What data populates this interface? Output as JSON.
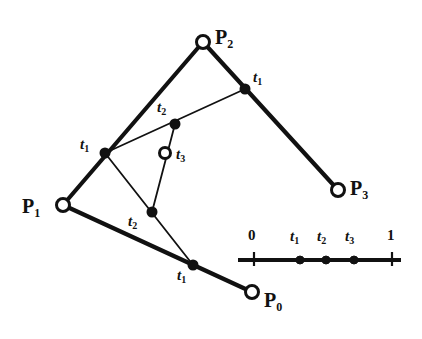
{
  "figure": {
    "kind": "de-casteljau-construction",
    "background_color": "#ffffff",
    "ink_color": "#111111",
    "width": 422,
    "height": 339,
    "thick_stroke": 4.2,
    "thin_stroke": 1.8
  },
  "control_points": [
    {
      "id": "p0",
      "label": "P",
      "sub": "0",
      "x": 252,
      "y": 292,
      "marker": "open-circle",
      "radius": 6.5,
      "label_x": 264,
      "label_y": 290
    },
    {
      "id": "p1",
      "label": "P",
      "sub": "1",
      "x": 63,
      "y": 205,
      "marker": "open-circle",
      "radius": 6.5,
      "label_x": 22,
      "label_y": 196
    },
    {
      "id": "p2",
      "label": "P",
      "sub": "2",
      "x": 203,
      "y": 42,
      "marker": "open-circle",
      "radius": 6.5,
      "label_x": 215,
      "label_y": 27
    },
    {
      "id": "p3",
      "label": "P",
      "sub": "3",
      "x": 338,
      "y": 190,
      "marker": "open-circle",
      "radius": 6.5,
      "label_x": 350,
      "label_y": 178
    }
  ],
  "level1_points": [
    {
      "id": "t1-lower",
      "label": "t",
      "sub": "1",
      "x": 193,
      "y": 265,
      "marker": "filled-dot",
      "radius": 4.5,
      "label_x": 177,
      "label_y": 268
    },
    {
      "id": "t1-left",
      "label": "t",
      "sub": "1",
      "x": 105,
      "y": 153,
      "marker": "filled-dot",
      "radius": 4.5,
      "label_x": 80,
      "label_y": 137
    },
    {
      "id": "t1-upper",
      "label": "t",
      "sub": "1",
      "x": 245,
      "y": 89,
      "marker": "filled-dot",
      "radius": 4.5,
      "label_x": 253,
      "label_y": 70
    }
  ],
  "level2_points": [
    {
      "id": "t2-lower",
      "label": "t",
      "sub": "2",
      "x": 152,
      "y": 212,
      "marker": "filled-dot",
      "radius": 4.5,
      "label_x": 128,
      "label_y": 214
    },
    {
      "id": "t2-upper",
      "label": "t",
      "sub": "2",
      "x": 175,
      "y": 124,
      "marker": "filled-dot",
      "radius": 4.5,
      "label_x": 157,
      "label_y": 100
    }
  ],
  "level3_points": [
    {
      "id": "t3",
      "label": "t",
      "sub": "3",
      "x": 165,
      "y": 153,
      "marker": "open-circle",
      "radius": 5.5,
      "label_x": 176,
      "label_y": 147
    }
  ],
  "control_polygon_segments": [
    {
      "id": "seg-p1-p2",
      "from": "p1",
      "to": "p2",
      "x1": 63,
      "y1": 205,
      "x2": 203,
      "y2": 42,
      "weight": "thick"
    },
    {
      "id": "seg-p2-p3",
      "from": "p2",
      "to": "p3",
      "x1": 203,
      "y1": 42,
      "x2": 338,
      "y2": 190,
      "weight": "thick"
    },
    {
      "id": "seg-p1-p0",
      "from": "p1",
      "to": "p0",
      "x1": 63,
      "y1": 205,
      "x2": 252,
      "y2": 292,
      "weight": "thick"
    }
  ],
  "level1_segments": [
    {
      "id": "seg-t1left-t1upper",
      "from": "t1-left",
      "to": "t1-upper",
      "x1": 105,
      "y1": 153,
      "x2": 245,
      "y2": 89,
      "weight": "thin"
    },
    {
      "id": "seg-t1left-t1lower",
      "from": "t1-left",
      "to": "t1-lower",
      "x1": 105,
      "y1": 153,
      "x2": 193,
      "y2": 265,
      "weight": "thin"
    }
  ],
  "level2_segments": [
    {
      "id": "seg-t2lower-t2upper",
      "from": "t2-lower",
      "to": "t2-upper",
      "x1": 152,
      "y1": 212,
      "x2": 175,
      "y2": 124,
      "weight": "thin"
    }
  ],
  "parameter_axis": {
    "id": "parameter-axis",
    "line_y": 260,
    "x_start": 238,
    "x_end": 401,
    "weight": "thick",
    "ticks": [
      {
        "id": "tick-0",
        "label": "0",
        "x": 254,
        "tick_top": 252,
        "tick_bottom": 266,
        "label_x": 248,
        "label_y": 228
      },
      {
        "id": "tick-1",
        "label": "1",
        "x": 392,
        "tick_top": 252,
        "tick_bottom": 266,
        "label_x": 387,
        "label_y": 228
      }
    ],
    "markers": [
      {
        "id": "axis-t1",
        "label": "t",
        "sub": "1",
        "x": 300,
        "y": 260,
        "radius": 4.0,
        "label_x": 290,
        "label_y": 229
      },
      {
        "id": "axis-t2",
        "label": "t",
        "sub": "2",
        "x": 326,
        "y": 260,
        "radius": 4.0,
        "label_x": 317,
        "label_y": 229
      },
      {
        "id": "axis-t3",
        "label": "t",
        "sub": "3",
        "x": 354,
        "y": 260,
        "radius": 4.0,
        "label_x": 345,
        "label_y": 229
      }
    ]
  }
}
